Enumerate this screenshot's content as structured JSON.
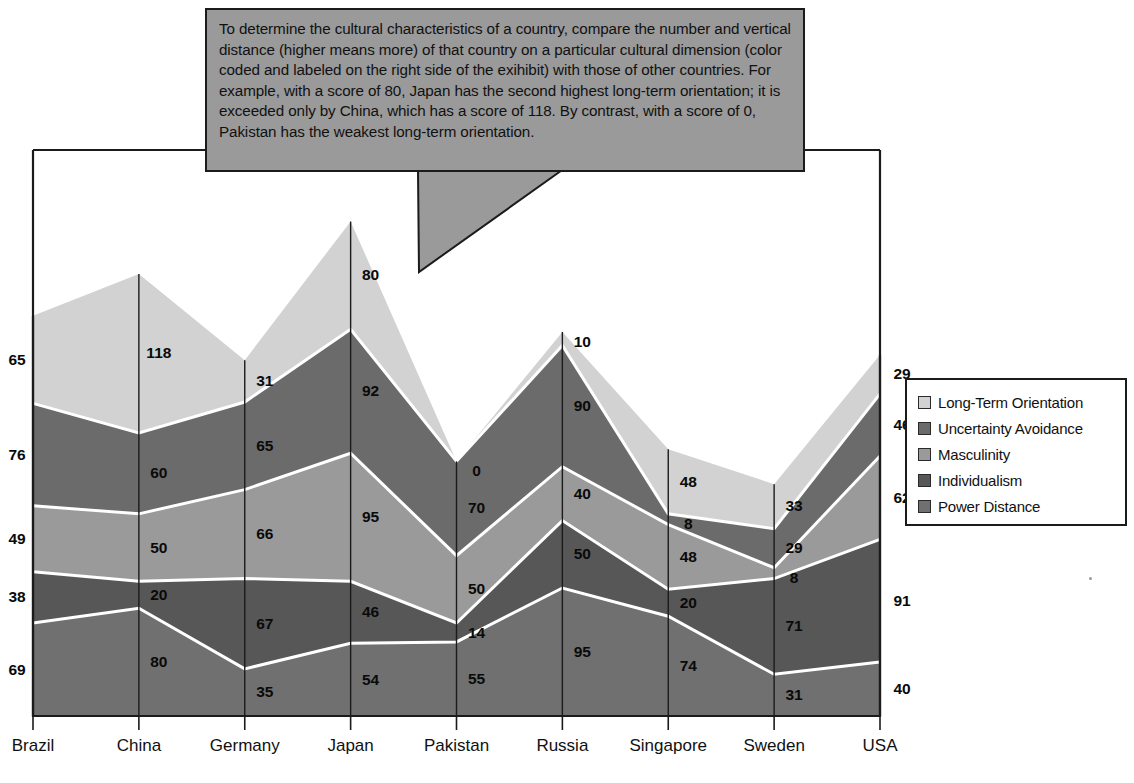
{
  "callout": {
    "text": "To determine the cultural characteristics of a country, compare the number and vertical distance (higher means more) of that country on a particular cultural dimension (color coded and labeled on the right side of the exihibit) with those of other countries.  For example, with a score of 80, Japan has the second highest long-term orientation; it is exceeded only by China, which has a score of 118.  By contrast, with a score of 0, Pakistan has the weakest long-term orientation."
  },
  "legend": {
    "items": [
      {
        "label": "Long-Term Orientation",
        "color": "#d2d2d2"
      },
      {
        "label": "Uncertainty Avoidance",
        "color": "#6b6b6b"
      },
      {
        "label": "Masculinity",
        "color": "#9a9a9a"
      },
      {
        "label": "Individualism",
        "color": "#575757"
      },
      {
        "label": "Power Distance",
        "color": "#707070"
      }
    ]
  },
  "chart_data": {
    "type": "area",
    "stacked": true,
    "title": "",
    "xlabel": "",
    "ylabel": "",
    "grid": true,
    "legend_position": "right",
    "ylim": [
      0,
      420
    ],
    "categories": [
      "Brazil",
      "China",
      "Germany",
      "Japan",
      "Pakistan",
      "Russia",
      "Singapore",
      "Sweden",
      "USA"
    ],
    "series": [
      {
        "name": "Power Distance",
        "color": "#707070",
        "values": [
          69,
          80,
          35,
          54,
          55,
          95,
          74,
          31,
          40
        ]
      },
      {
        "name": "Individualism",
        "color": "#575757",
        "values": [
          38,
          20,
          67,
          46,
          14,
          50,
          20,
          71,
          91
        ]
      },
      {
        "name": "Masculinity",
        "color": "#9a9a9a",
        "values": [
          49,
          50,
          66,
          95,
          50,
          40,
          48,
          8,
          62
        ]
      },
      {
        "name": "Uncertainty Avoidance",
        "color": "#6b6b6b",
        "values": [
          76,
          60,
          65,
          92,
          70,
          90,
          8,
          29,
          46
        ]
      },
      {
        "name": "Long-Term Orientation",
        "color": "#d2d2d2",
        "values": [
          65,
          118,
          31,
          80,
          0,
          10,
          48,
          33,
          29
        ]
      }
    ]
  }
}
